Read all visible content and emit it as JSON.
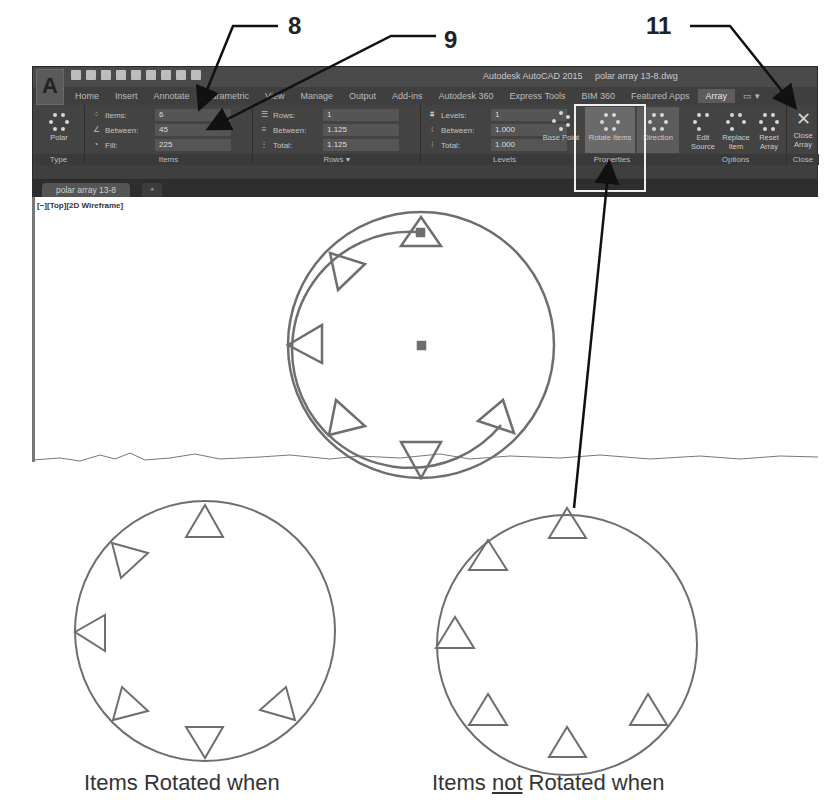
{
  "callouts": [
    {
      "number": "8",
      "target": "items-count-field"
    },
    {
      "number": "9",
      "target": "items-between-field"
    },
    {
      "number": "11",
      "target": "close-array-button"
    }
  ],
  "window": {
    "app_title": "Autodesk AutoCAD 2015",
    "document_title": "polar array 13-8.dwg",
    "app_button": "A"
  },
  "ribbon": {
    "tabs": [
      "Home",
      "Insert",
      "Annotate",
      "Parametric",
      "View",
      "Manage",
      "Output",
      "Add-ins",
      "Autodesk 360",
      "Express Tools",
      "BIM 360",
      "Featured Apps",
      "Array"
    ],
    "active_tab": "Array",
    "type_panel": {
      "title": "Type",
      "button": "Polar"
    },
    "items_panel": {
      "title": "Items",
      "rows": [
        {
          "label": "Items:",
          "value": "6"
        },
        {
          "label": "Between:",
          "value": "45"
        },
        {
          "label": "Fill:",
          "value": "225"
        }
      ]
    },
    "rows_panel": {
      "title": "Rows ▾",
      "rows": [
        {
          "label": "Rows:",
          "value": "1"
        },
        {
          "label": "Between:",
          "value": "1.125"
        },
        {
          "label": "Total:",
          "value": "1.125"
        }
      ]
    },
    "levels_panel": {
      "title": "Levels",
      "rows": [
        {
          "label": "Levels:",
          "value": "1"
        },
        {
          "label": "Between:",
          "value": "1.000"
        },
        {
          "label": "Total:",
          "value": "1.000"
        }
      ]
    },
    "properties_panel": {
      "title": "Properties",
      "buttons": [
        "Base Point",
        "Rotate Items",
        "Direction"
      ]
    },
    "options_panel": {
      "title": "Options",
      "buttons": [
        "Edit Source",
        "Replace Item",
        "Reset Array"
      ]
    },
    "close_panel": {
      "title": "Close",
      "button": "Close Array",
      "icon": "close-icon"
    }
  },
  "document_tabs": {
    "active": "polar array 13-8",
    "new_tab": "+"
  },
  "viewport": {
    "label": "[−][Top][2D Wireframe]"
  },
  "captions": {
    "left": "Items Rotated when",
    "right_prefix": "Items ",
    "right_underlined": "not",
    "right_suffix": " Rotated when"
  },
  "colors": {
    "ribbon_bg": "#434343",
    "drawing_stroke": "#6e6e6e",
    "highlight_box": "#eeeeee"
  }
}
